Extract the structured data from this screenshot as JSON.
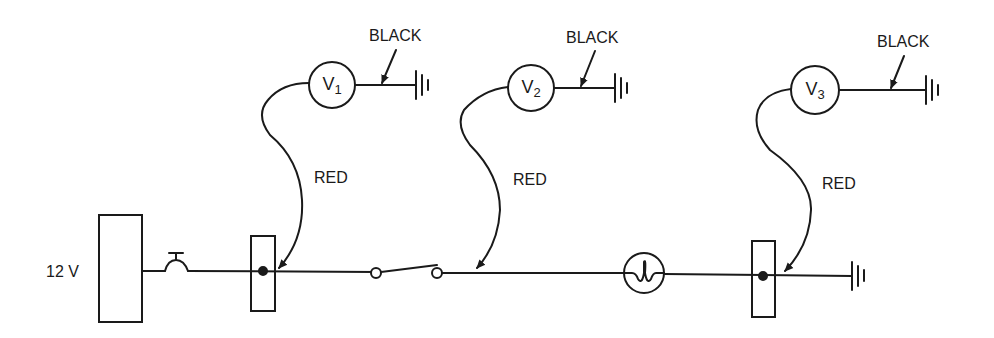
{
  "diagram": {
    "type": "circuit",
    "source": {
      "label": "12 V"
    },
    "wire_labels": {
      "black": "BLACK",
      "red": "RED"
    },
    "voltmeters": [
      {
        "id": "V1",
        "letter": "V",
        "sub": "1",
        "ground_wire": "BLACK",
        "probe_wire": "RED"
      },
      {
        "id": "V2",
        "letter": "V",
        "sub": "2",
        "ground_wire": "BLACK",
        "probe_wire": "RED"
      },
      {
        "id": "V3",
        "letter": "V",
        "sub": "3",
        "ground_wire": "BLACK",
        "probe_wire": "RED"
      }
    ],
    "components": [
      "battery-12v",
      "circuit-breaker",
      "connector-1",
      "switch",
      "lamp",
      "connector-2",
      "ground"
    ],
    "colors": {
      "ink": "#1a1a1a",
      "background": "#ffffff"
    }
  }
}
